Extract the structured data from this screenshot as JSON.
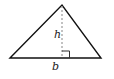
{
  "diagram": {
    "type": "triangle",
    "labels": {
      "height": "h",
      "base": "b"
    },
    "vertices": {
      "left": [
        10,
        58
      ],
      "apex": [
        62,
        5
      ],
      "right": [
        101,
        58
      ]
    },
    "altitude": {
      "style": "dashed",
      "right_angle_marker": true
    },
    "colors": {
      "stroke": "#111111",
      "dashed": "#9a9a9a",
      "background": "#ffffff"
    }
  }
}
